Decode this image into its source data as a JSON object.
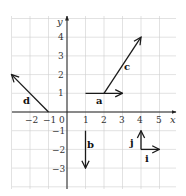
{
  "diagram": {
    "type": "vector-grid",
    "axes": {
      "x_label": "x",
      "y_label": "y",
      "x_ticks": [
        "−2",
        "−1",
        "0",
        "1",
        "2",
        "3",
        "4",
        "5"
      ],
      "y_ticks": [
        "4",
        "3",
        "2",
        "1",
        "−1",
        "−2",
        "−3"
      ],
      "x_range": [
        -3,
        6
      ],
      "y_range": [
        -4,
        5
      ]
    },
    "vectors": [
      {
        "label": "a",
        "from": [
          1,
          1
        ],
        "to": [
          3,
          1
        ]
      },
      {
        "label": "b",
        "from": [
          1,
          -1
        ],
        "to": [
          1,
          -3
        ]
      },
      {
        "label": "c",
        "from": [
          2,
          1
        ],
        "to": [
          4,
          4
        ]
      },
      {
        "label": "d",
        "from": [
          -1,
          0
        ],
        "to": [
          -3,
          2
        ]
      },
      {
        "label": "i",
        "from": [
          4,
          -2
        ],
        "to": [
          5,
          -2
        ]
      },
      {
        "label": "j",
        "from": [
          4,
          -2
        ],
        "to": [
          4,
          -1
        ]
      }
    ]
  }
}
